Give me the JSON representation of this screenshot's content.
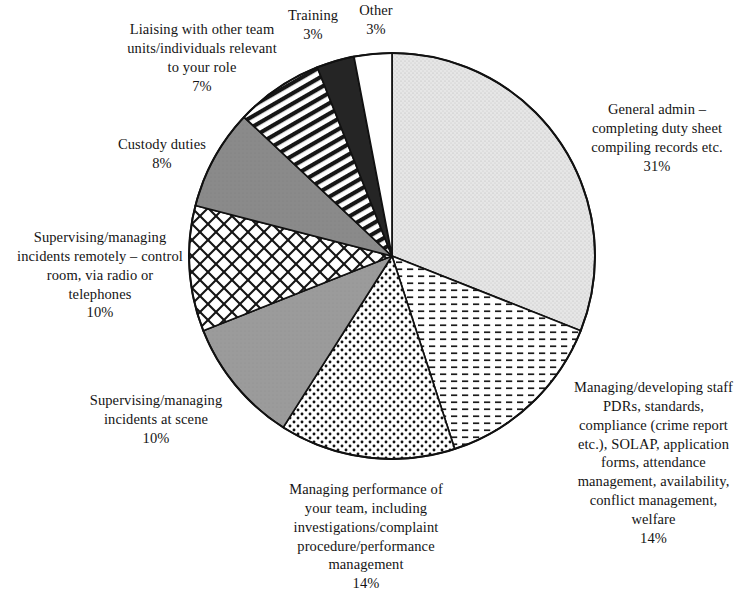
{
  "chart_data": {
    "type": "pie",
    "title": "",
    "subtitle": "",
    "xlabel": "",
    "ylabel": "",
    "legend_position": "none",
    "grid": false,
    "units": "percent",
    "total": 100,
    "start_angle_deg": 0,
    "direction": "clockwise",
    "categories": [
      "General admin – completing duty sheet compiling records etc.",
      "Managing/developing staff PDRs, standards, compliance (crime report etc.), SOLAP, application forms, attendance management, availability, conflict management, welfare",
      "Managing performance of your team, including investigations/complaint procedure/performance management",
      "Supervising/managing incidents at scene",
      "Supervising/managing incidents remotely – control room, via radio or telephones",
      "Custody duties",
      "Liaising with other team units/individuals relevant to your role",
      "Training",
      "Other"
    ],
    "values": [
      31,
      14,
      14,
      10,
      10,
      8,
      7,
      3,
      3
    ],
    "slices": [
      {
        "id": "general-admin",
        "label": "General admin – completing duty sheet compiling records etc.",
        "value": 31,
        "pct_label": "31%",
        "fill": "#e2e2e2",
        "pattern": "fine-stipple",
        "stroke": "#111111"
      },
      {
        "id": "managing-developing-staff",
        "label": "Managing/developing staff PDRs, standards, compliance (crime report etc.), SOLAP, application forms, attendance management, availability, conflict management, welfare",
        "value": 14,
        "pct_label": "14%",
        "fill": "#ffffff",
        "pattern": "horizontal-dashes",
        "stroke": "#111111"
      },
      {
        "id": "managing-performance",
        "label": "Managing performance of your team, including investigations/complaint procedure/performance management",
        "value": 14,
        "pct_label": "14%",
        "fill": "#ffffff",
        "pattern": "dense-dots",
        "stroke": "#111111"
      },
      {
        "id": "incidents-at-scene",
        "label": "Supervising/managing incidents at scene",
        "value": 10,
        "pct_label": "10%",
        "fill": "#9b9b9b",
        "pattern": "solid-grey",
        "stroke": "#111111"
      },
      {
        "id": "incidents-remotely",
        "label": "Supervising/managing incidents remotely – control room, via radio or telephones",
        "value": 10,
        "pct_label": "10%",
        "fill": "#ffffff",
        "pattern": "diagonal-crosshatch",
        "stroke": "#111111"
      },
      {
        "id": "custody-duties",
        "label": "Custody duties",
        "value": 8,
        "pct_label": "8%",
        "fill": "#8a8a8a",
        "pattern": "solid-dark-grey",
        "stroke": "#111111"
      },
      {
        "id": "liaising",
        "label": "Liaising with other team units/individuals relevant to your role",
        "value": 7,
        "pct_label": "7%",
        "fill": "#ffffff",
        "pattern": "diagonal-stripes",
        "stroke": "#111111"
      },
      {
        "id": "training",
        "label": "Training",
        "value": 3,
        "pct_label": "3%",
        "fill": "#252525",
        "pattern": "solid-black",
        "stroke": "#111111"
      },
      {
        "id": "other",
        "label": "Other",
        "value": 3,
        "pct_label": "3%",
        "fill": "#ffffff",
        "pattern": "none",
        "stroke": "#111111"
      }
    ]
  },
  "labels": {
    "general_admin": {
      "line1": "General admin –",
      "line2": "completing duty sheet",
      "line3": "compiling records etc.",
      "pct": "31%"
    },
    "managing_developing_staff": {
      "line1": "Managing/developing staff",
      "line2": "PDRs, standards,",
      "line3": "compliance (crime report",
      "line4": "etc.), SOLAP, application",
      "line5": "forms, attendance",
      "line6": "management, availability,",
      "line7": "conflict management,",
      "line8": "welfare",
      "pct": "14%"
    },
    "managing_performance": {
      "line1": "Managing performance of",
      "line2": "your team, including",
      "line3": "investigations/complaint",
      "line4": "procedure/performance",
      "line5": "management",
      "pct": "14%"
    },
    "incidents_at_scene": {
      "line1": "Supervising/managing",
      "line2": "incidents at scene",
      "pct": "10%"
    },
    "incidents_remotely": {
      "line1": "Supervising/managing",
      "line2": "incidents remotely – control",
      "line3": "room, via radio or",
      "line4": "telephones",
      "pct": "10%"
    },
    "custody_duties": {
      "line1": "Custody duties",
      "pct": "8%"
    },
    "liaising": {
      "line1": "Liaising with other team",
      "line2": "units/individuals relevant",
      "line3": "to your role",
      "pct": "7%"
    },
    "training": {
      "line1": "Training",
      "pct": "3%"
    },
    "other": {
      "line1": "Other",
      "pct": "3%"
    }
  }
}
